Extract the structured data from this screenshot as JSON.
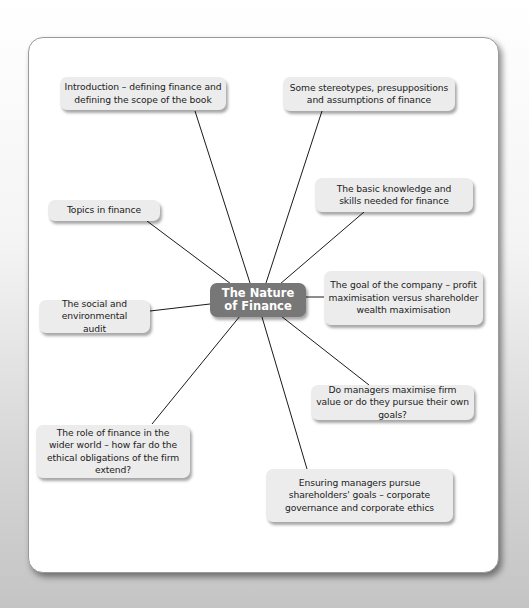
{
  "diagram": {
    "central_topic": "The Nature\nof Finance",
    "branches": [
      {
        "id": "intro",
        "label": "Introduction – defining finance and defining the scope of the book"
      },
      {
        "id": "stereotypes",
        "label": "Some stereotypes, presuppositions and assumptions of finance"
      },
      {
        "id": "basic-knowledge",
        "label": "The basic knowledge and skills needed for finance"
      },
      {
        "id": "topics",
        "label": "Topics in finance"
      },
      {
        "id": "goal",
        "label": "The goal of the company – profit maximisation versus shareholder wealth maximisation"
      },
      {
        "id": "social-audit",
        "label": "The social and environmental audit"
      },
      {
        "id": "managers-value",
        "label": "Do managers maximise firm value or do they pursue their own goals?"
      },
      {
        "id": "role-wider-world",
        "label": "The role of finance in the wider world – how far do the ethical obligations of the firm extend?"
      },
      {
        "id": "governance",
        "label": "Ensuring managers pursue shareholders' goals – corporate governance and corporate ethics"
      }
    ]
  }
}
